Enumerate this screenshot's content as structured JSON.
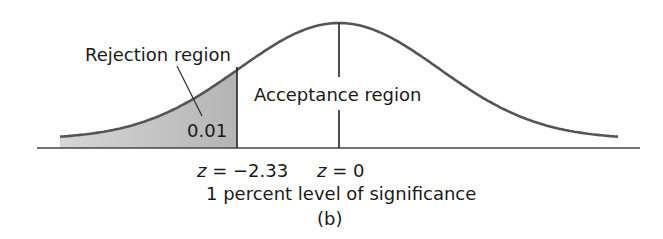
{
  "figure": {
    "rejection_label": "Rejection region",
    "acceptance_label": "Acceptance region",
    "tail_probability": "0.01",
    "critical_z_label_var": "z",
    "critical_z_label_rest": " = −2.33",
    "center_z_label_var": "z",
    "center_z_label_rest": " = 0",
    "caption": "1 percent level of significance",
    "panel_label": "(b)"
  },
  "chart_data": {
    "type": "area",
    "title": "1 percent level of significance",
    "subtitle": "(b)",
    "distribution": "standard normal",
    "critical_value": -2.33,
    "center": 0,
    "alpha": 0.01,
    "test": "one-tailed (left)",
    "regions": [
      {
        "name": "Rejection region",
        "range": [
          "-inf",
          -2.33
        ],
        "probability": 0.01,
        "shaded": true
      },
      {
        "name": "Acceptance region",
        "range": [
          -2.33,
          "inf"
        ],
        "probability": 0.99,
        "shaded": false
      }
    ],
    "tick_labels": [
      "z = −2.33",
      "z = 0"
    ],
    "colors": {
      "curve": "#555555",
      "shade": "#bdbdbd",
      "axis": "#444444"
    }
  }
}
